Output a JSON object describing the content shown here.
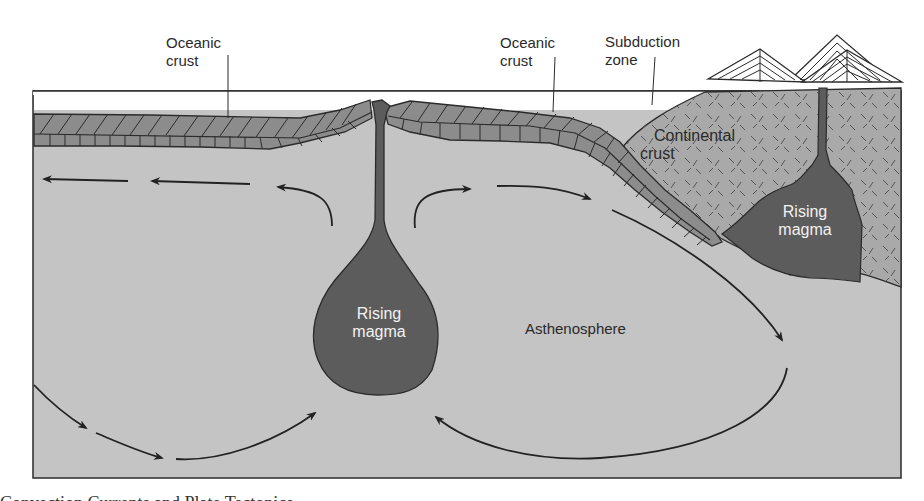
{
  "diagram": {
    "labels": {
      "oceanic_crust_left": [
        "Oceanic",
        "crust"
      ],
      "oceanic_crust_right": [
        "Oceanic",
        "crust"
      ],
      "subduction_zone": [
        "Subduction",
        "zone"
      ],
      "continental_crust": [
        "Continental",
        "crust"
      ],
      "rising_magma_ridge": [
        "Rising",
        "magma"
      ],
      "rising_magma_continent": [
        "Rising",
        "magma"
      ],
      "asthenosphere": "Asthenosphere"
    },
    "caption_partial": "Convection Currents and Plate Tectonics"
  },
  "colors": {
    "background": "#ffffff",
    "asthenosphere": "#c4c4c4",
    "crust_block": "#8c8c8c",
    "continental_crust": "#a9a9a9",
    "magma": "#5c5c5c",
    "outline": "#2b2b2b",
    "magma_text": "#f2f2f2"
  }
}
